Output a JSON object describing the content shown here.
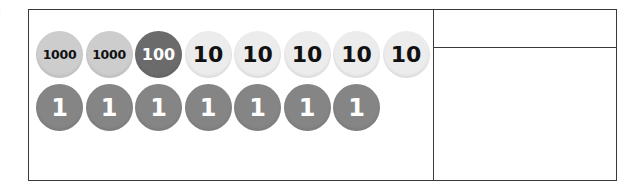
{
  "label_fragment": ")",
  "counters": {
    "row_1": [
      {
        "value": "1000",
        "type": "thousand",
        "color": "#cdcdcd",
        "text_color": "#111111"
      },
      {
        "value": "1000",
        "type": "thousand",
        "color": "#cdcdcd",
        "text_color": "#111111"
      },
      {
        "value": "100",
        "type": "hundred",
        "color": "#6b6b6b",
        "text_color": "#ffffff"
      },
      {
        "value": "10",
        "type": "ten",
        "color": "#ececec",
        "text_color": "#111111"
      },
      {
        "value": "10",
        "type": "ten",
        "color": "#ececec",
        "text_color": "#111111"
      },
      {
        "value": "10",
        "type": "ten",
        "color": "#ececec",
        "text_color": "#111111"
      },
      {
        "value": "10",
        "type": "ten",
        "color": "#ececec",
        "text_color": "#111111"
      },
      {
        "value": "10",
        "type": "ten",
        "color": "#ececec",
        "text_color": "#111111"
      }
    ],
    "row_2": [
      {
        "value": "1",
        "type": "one",
        "color": "#858585",
        "text_color": "#ffffff"
      },
      {
        "value": "1",
        "type": "one",
        "color": "#858585",
        "text_color": "#ffffff"
      },
      {
        "value": "1",
        "type": "one",
        "color": "#858585",
        "text_color": "#ffffff"
      },
      {
        "value": "1",
        "type": "one",
        "color": "#858585",
        "text_color": "#ffffff"
      },
      {
        "value": "1",
        "type": "one",
        "color": "#858585",
        "text_color": "#ffffff"
      },
      {
        "value": "1",
        "type": "one",
        "color": "#858585",
        "text_color": "#ffffff"
      },
      {
        "value": "1",
        "type": "one",
        "color": "#858585",
        "text_color": "#ffffff"
      }
    ]
  },
  "answer_boxes": {
    "top": "",
    "bottom": ""
  },
  "colors": {
    "border": "#3a3a3a",
    "background": "#ffffff"
  }
}
